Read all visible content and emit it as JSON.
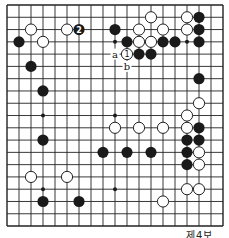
{
  "diagram": {
    "type": "go-board",
    "size": 19,
    "origin_x": 7,
    "origin_y": 5,
    "spacing_x": 12,
    "spacing_y": 12.28,
    "line_color": "#222222",
    "black_color": "#1a1a1a",
    "white_fill": "#ffffff",
    "star_points": [
      [
        3,
        3
      ],
      [
        9,
        3
      ],
      [
        15,
        3
      ],
      [
        3,
        9
      ],
      [
        9,
        9
      ],
      [
        15,
        9
      ],
      [
        3,
        15
      ],
      [
        9,
        15
      ],
      [
        15,
        15
      ]
    ],
    "black_stones": [
      {
        "c": 1,
        "r": 3
      },
      {
        "c": 2,
        "r": 5
      },
      {
        "c": 3,
        "r": 7
      },
      {
        "c": 6,
        "r": 2,
        "label": "2"
      },
      {
        "c": 9,
        "r": 2
      },
      {
        "c": 10,
        "r": 3
      },
      {
        "c": 11,
        "r": 4
      },
      {
        "c": 12,
        "r": 4
      },
      {
        "c": 13,
        "r": 3
      },
      {
        "c": 14,
        "r": 3
      },
      {
        "c": 16,
        "r": 1
      },
      {
        "c": 16,
        "r": 2
      },
      {
        "c": 16,
        "r": 3
      },
      {
        "c": 16,
        "r": 6
      },
      {
        "c": 3,
        "r": 11
      },
      {
        "c": 8,
        "r": 12
      },
      {
        "c": 10,
        "r": 12
      },
      {
        "c": 12,
        "r": 12
      },
      {
        "c": 15,
        "r": 11
      },
      {
        "c": 16,
        "r": 11
      },
      {
        "c": 16,
        "r": 10
      },
      {
        "c": 15,
        "r": 12
      },
      {
        "c": 15,
        "r": 13
      },
      {
        "c": 3,
        "r": 16
      },
      {
        "c": 6,
        "r": 16
      }
    ],
    "white_stones": [
      {
        "c": 2,
        "r": 2
      },
      {
        "c": 3,
        "r": 3
      },
      {
        "c": 5,
        "r": 2
      },
      {
        "c": 11,
        "r": 2
      },
      {
        "c": 12,
        "r": 1
      },
      {
        "c": 13,
        "r": 2
      },
      {
        "c": 15,
        "r": 1
      },
      {
        "c": 15,
        "r": 2
      },
      {
        "c": 11,
        "r": 3
      },
      {
        "c": 12,
        "r": 3
      },
      {
        "c": 10,
        "r": 4,
        "label": "1"
      },
      {
        "c": 16,
        "r": 8
      },
      {
        "c": 15,
        "r": 9
      },
      {
        "c": 9,
        "r": 10
      },
      {
        "c": 11,
        "r": 10
      },
      {
        "c": 13,
        "r": 10
      },
      {
        "c": 15,
        "r": 10
      },
      {
        "c": 16,
        "r": 12
      },
      {
        "c": 16,
        "r": 13
      },
      {
        "c": 15,
        "r": 15
      },
      {
        "c": 16,
        "r": 15
      },
      {
        "c": 13,
        "r": 16
      },
      {
        "c": 2,
        "r": 14
      },
      {
        "c": 5,
        "r": 14
      }
    ],
    "letter_marks": [
      {
        "c": 9,
        "r": 4,
        "label": "a"
      },
      {
        "c": 10,
        "r": 5,
        "label": "b"
      }
    ]
  },
  "caption": "제4보"
}
